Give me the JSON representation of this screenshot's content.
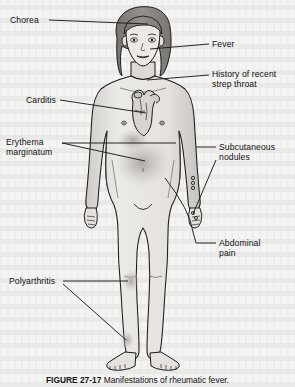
{
  "figure": {
    "title": "Manifestations of rheumatic fever",
    "caption_number": "FIGURE 27-17",
    "caption_text": "Manifestations of rheumatic fever."
  },
  "colors": {
    "page_background": "#f4f4f2",
    "skin_fill": "#e9e7e4",
    "skin_shadow": "#c9c6c2",
    "hair_fill": "#8d8a86",
    "outline": "#1a1a1a",
    "leader_line": "#1a1a1a",
    "lesion_blush": "#a8a49f",
    "label_text": "#101010"
  },
  "labels": [
    {
      "id": "chorea",
      "text": "Chorea",
      "side": "left",
      "x": 10,
      "y": 16
    },
    {
      "id": "carditis",
      "text": "Carditis",
      "side": "left",
      "x": 26,
      "y": 97
    },
    {
      "id": "erythema",
      "text": "Erythema\nmarginatum",
      "side": "left",
      "x": 6,
      "y": 139
    },
    {
      "id": "polyarthritis",
      "text": "Polyarthritis",
      "side": "left",
      "x": 9,
      "y": 277
    },
    {
      "id": "fever",
      "text": "Fever",
      "side": "right",
      "x": 212,
      "y": 40
    },
    {
      "id": "strep-throat",
      "text": "History of recent\nstrep throat",
      "side": "right",
      "x": 212,
      "y": 70
    },
    {
      "id": "subcutaneous",
      "text": "Subcutaneous\nnodules",
      "side": "right",
      "x": 219,
      "y": 144
    },
    {
      "id": "abdominal-pain",
      "text": "Abdominal\npain",
      "side": "right",
      "x": 219,
      "y": 239
    }
  ],
  "leader_lines": [
    {
      "id": "leader-chorea",
      "from_label": "chorea",
      "to_part": "head-scalp"
    },
    {
      "id": "leader-fever",
      "from_label": "fever",
      "to_part": "face-cheek"
    },
    {
      "id": "leader-strep-throat",
      "from_label": "strep-throat",
      "to_part": "throat-neck"
    },
    {
      "id": "leader-carditis",
      "from_label": "carditis",
      "to_part": "heart-chest"
    },
    {
      "id": "leader-erythema",
      "from_label": "erythema",
      "to_part": "trunk-rash"
    },
    {
      "id": "leader-subcutaneous",
      "from_label": "subcutaneous",
      "to_part": "right-wrist"
    },
    {
      "id": "leader-abdominal",
      "from_label": "abdominal-pain",
      "to_part": "abdomen"
    },
    {
      "id": "leader-polyarthritis",
      "from_label": "polyarthritis",
      "to_part": "knee-and-ankle"
    }
  ],
  "anatomy_marks": [
    {
      "id": "heart",
      "label": "heart-illustration",
      "region": "left-chest"
    },
    {
      "id": "rash-trunk",
      "label": "erythema-marginatum",
      "region": "abdomen-and-trunk"
    },
    {
      "id": "nodule-wrist",
      "label": "subcutaneous-nodule",
      "region": "right-wrist"
    },
    {
      "id": "nodule-hand",
      "label": "subcutaneous-nodule",
      "region": "left-hand"
    },
    {
      "id": "joint-knee",
      "label": "polyarthritis-joint",
      "region": "right-knee"
    },
    {
      "id": "joint-ankle",
      "label": "polyarthritis-joint",
      "region": "right-ankle"
    }
  ]
}
